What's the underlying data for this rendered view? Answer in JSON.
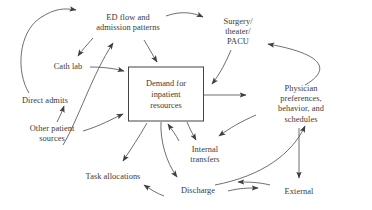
{
  "diagram": {
    "type": "causal-loop-diagram",
    "stroke_color": "#4a4a4a",
    "text_color": "#3a3a3a",
    "background_color": "#ffffff",
    "nodes": [
      {
        "id": "ed-flow",
        "label": "ED flow and\nadmission patterns",
        "shape": "text",
        "x": 128,
        "y": 23
      },
      {
        "id": "surgery",
        "label": "Surgery/\ntheater/\nPACU",
        "shape": "text",
        "x": 238,
        "y": 32
      },
      {
        "id": "cath-lab",
        "label": "Cath lab",
        "shape": "text",
        "x": 68,
        "y": 67
      },
      {
        "id": "direct-admits",
        "label": "Direct admits",
        "shape": "text",
        "x": 45,
        "y": 101
      },
      {
        "id": "other-patient-sources",
        "label": "Other patient\nsources",
        "shape": "text",
        "x": 52,
        "y": 134
      },
      {
        "id": "demand",
        "label": "Demand for\ninpatient\nresources",
        "shape": "box",
        "x": 166,
        "y": 94,
        "width": 74,
        "height": 53
      },
      {
        "id": "physician",
        "label": "Physician preferences,\nbehavior, and\nschedules",
        "shape": "text",
        "x": 301,
        "y": 104
      },
      {
        "id": "internal-transfers",
        "label": "Internal\ntransfers",
        "shape": "text",
        "x": 205,
        "y": 155
      },
      {
        "id": "task-allocations",
        "label": "Task allocations",
        "shape": "text",
        "x": 113,
        "y": 177
      },
      {
        "id": "discharge",
        "label": "Discharge",
        "shape": "text",
        "x": 198,
        "y": 191
      },
      {
        "id": "external",
        "label": "External",
        "shape": "text",
        "x": 299,
        "y": 192
      }
    ],
    "edges": [
      {
        "id": "direct-admits-to-ed-flow",
        "from": "direct-admits",
        "to": "ed-flow"
      },
      {
        "id": "ed-flow-to-cath-lab",
        "from": "ed-flow",
        "to": "cath-lab"
      },
      {
        "id": "ed-flow-to-surgery",
        "from": "ed-flow",
        "to": "surgery"
      },
      {
        "id": "ed-flow-to-demand",
        "from": "ed-flow",
        "to": "demand"
      },
      {
        "id": "other-sources-to-ed-flow",
        "from": "other-patient-sources",
        "to": "ed-flow"
      },
      {
        "id": "cath-lab-to-demand",
        "from": "cath-lab",
        "to": "demand"
      },
      {
        "id": "other-sources-to-demand",
        "from": "other-patient-sources",
        "to": "demand"
      },
      {
        "id": "direct-admits-up",
        "from": "other-patient-sources",
        "to": "direct-admits"
      },
      {
        "id": "surgery-to-demand",
        "from": "surgery",
        "to": "demand"
      },
      {
        "id": "demand-to-physician",
        "from": "demand",
        "to": "physician"
      },
      {
        "id": "physician-to-surgery",
        "from": "physician",
        "to": "surgery"
      },
      {
        "id": "physician-to-internal-transfers",
        "from": "physician",
        "to": "internal-transfers"
      },
      {
        "id": "demand-to-internal-transfers",
        "from": "demand",
        "to": "internal-transfers"
      },
      {
        "id": "internal-transfers-to-demand",
        "from": "internal-transfers",
        "to": "demand"
      },
      {
        "id": "demand-to-task-allocations",
        "from": "demand",
        "to": "task-allocations"
      },
      {
        "id": "demand-to-discharge",
        "from": "demand",
        "to": "discharge"
      },
      {
        "id": "discharge-to-task-allocations",
        "from": "discharge",
        "to": "task-allocations"
      },
      {
        "id": "discharge-to-external",
        "from": "discharge",
        "to": "external"
      },
      {
        "id": "external-to-discharge",
        "from": "external",
        "to": "discharge"
      },
      {
        "id": "discharge-to-physician",
        "from": "discharge",
        "to": "physician"
      },
      {
        "id": "physician-to-external",
        "from": "physician",
        "to": "external"
      }
    ]
  }
}
